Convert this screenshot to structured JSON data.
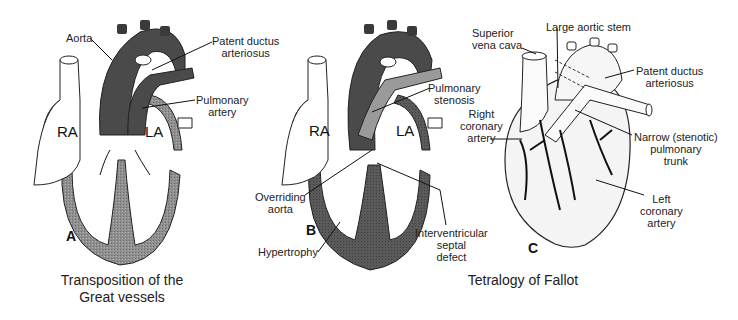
{
  "panels": {
    "A": {
      "letter": "A",
      "chambers": {
        "ra": "RA",
        "la": "LA"
      },
      "labels": {
        "aorta": "Aorta",
        "pda_1": "Patent ductus",
        "pda_2": "arteriosus",
        "pa_1": "Pulmonary",
        "pa_2": "artery"
      },
      "caption_1": "Transposition of the",
      "caption_2": "Great vessels"
    },
    "B": {
      "letter": "B",
      "chambers": {
        "ra": "RA",
        "la": "LA"
      },
      "labels": {
        "ps_1": "Pulmonary",
        "ps_2": "stenosis",
        "oa_1": "Overriding",
        "oa_2": "aorta",
        "hyp": "Hypertrophy",
        "vsd_1": "Interventricular",
        "vsd_2": "septal",
        "vsd_3": "defect"
      }
    },
    "C": {
      "letter": "C",
      "labels": {
        "svc_1": "Superior",
        "svc_2": "vena cava",
        "las": "Large aortic stem",
        "pda_1": "Patent ductus",
        "pda_2": "arteriosus",
        "rca_1": "Right",
        "rca_2": "coronary",
        "rca_3": "artery",
        "npt_1": "Narrow (stenotic)",
        "npt_2": "pulmonary",
        "npt_3": "trunk",
        "lca_1": "Left",
        "lca_2": "coronary",
        "lca_3": "artery"
      }
    },
    "BC_caption": "Tetralogy of Fallot"
  },
  "colors": {
    "vessel_dark": "#4a4a4a",
    "vessel_light": "#9a9a9a",
    "wall_gray": "#8c8c8c",
    "outline": "#111111"
  }
}
